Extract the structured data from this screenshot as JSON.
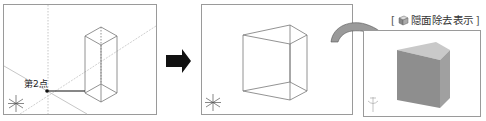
{
  "panels": [
    {
      "id": "panel-1",
      "description": "wireframe box with construction lines",
      "point_label": "第2点",
      "bounds": {
        "x": 3,
        "y": 4,
        "w": 154,
        "h": 111
      }
    },
    {
      "id": "panel-2",
      "description": "wireframe wedge (triangular prism)",
      "bounds": {
        "x": 201,
        "y": 4,
        "w": 152,
        "h": 111
      }
    },
    {
      "id": "panel-3",
      "description": "shaded wedge with hidden surfaces removed",
      "caption": {
        "open_bracket": "[",
        "icon": "hidden-surface-removal-icon",
        "text": "隠面除去表示",
        "close_bracket": "]"
      },
      "bounds": {
        "x": 363,
        "y": 30,
        "w": 118,
        "h": 87
      }
    }
  ],
  "arrows": [
    {
      "id": "black-right-arrow",
      "color": "#111111"
    },
    {
      "id": "curved-gray-arrow",
      "color": "#9a9a9a"
    }
  ],
  "colors": {
    "frame": "#9a9a9a",
    "wire": "#777777",
    "guide": "#b8b8b8",
    "solid_side": "#8e8e8e",
    "solid_top": "#c9c9c9"
  }
}
